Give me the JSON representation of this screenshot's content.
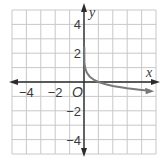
{
  "chart_data": {
    "type": "line",
    "title": "",
    "xlabel": "x",
    "ylabel": "y",
    "origin_label": "O",
    "xlim": [
      -5,
      5
    ],
    "ylim": [
      -5,
      5
    ],
    "grid": true,
    "grid_step": 1,
    "x_tick_labels": [
      {
        "value": -4,
        "label": "−4"
      },
      {
        "value": -2,
        "label": "−2"
      }
    ],
    "y_tick_labels": [
      {
        "value": 4,
        "label": "4"
      },
      {
        "value": 2,
        "label": "2"
      },
      {
        "value": -2,
        "label": "−2"
      },
      {
        "value": -4,
        "label": "−4"
      }
    ],
    "series": [
      {
        "name": "curve",
        "description": "decreasing curve with vertical asymptote at x = 0, passes through (1, 0), arrow toward right",
        "x": [
          0.03,
          0.05,
          0.1,
          0.2,
          0.4,
          0.7,
          1,
          1.5,
          2,
          3,
          4,
          4.6
        ],
        "y": [
          1.4,
          1.2,
          0.92,
          0.64,
          0.37,
          0.14,
          0,
          -0.16,
          -0.28,
          -0.44,
          -0.55,
          -0.61
        ]
      }
    ],
    "colors": {
      "axis": "#2b2b2b",
      "grid": "#c8c8c8",
      "curve": "#7a7a7a"
    }
  }
}
